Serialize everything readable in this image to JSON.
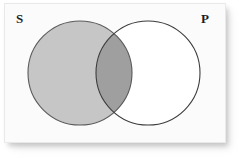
{
  "figure": {
    "type": "venn-diagram",
    "title": "",
    "background_color": "#ffffff",
    "panel": {
      "fill": "#fbfbfb",
      "border_color": "#e9e9e9",
      "shadow": "bottom-right drop shadow"
    }
  },
  "labels": {
    "left_circle": "S",
    "right_circle": "P"
  },
  "circles": [
    {
      "name": "subject-circle",
      "label": "S",
      "cx": 80,
      "cy": 73,
      "r": 52,
      "fill": "#c6c6c6",
      "stroke": "#5a5a5a"
    },
    {
      "name": "predicate-circle",
      "label": "P",
      "cx": 148,
      "cy": 73,
      "r": 52,
      "fill": "#ffffff",
      "stroke": "#3c3c3c"
    }
  ],
  "regions": [
    {
      "name": "s-only",
      "description": "S not P",
      "shading": "shaded",
      "fill": "#c6c6c6"
    },
    {
      "name": "s-and-p",
      "description": "S and P overlap",
      "shading": "shaded-dark",
      "fill": "#9f9f9f"
    },
    {
      "name": "p-only",
      "description": "P not S",
      "shading": "unshaded",
      "fill": "#ffffff"
    }
  ],
  "colors": {
    "light_shade": "#c6c6c6",
    "dark_shade": "#9f9f9f",
    "unshaded": "#ffffff",
    "stroke_left": "#5a5a5a",
    "stroke_right": "#3c3c3c",
    "label_color": "#1d1d1d"
  }
}
